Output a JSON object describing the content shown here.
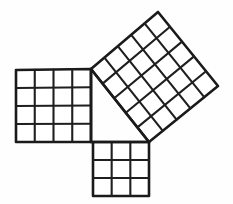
{
  "figure": {
    "background_color": "#fefefe",
    "line_color": "#1a1a1a"
  },
  "chart_data": {
    "type": "diagram",
    "xlabel": "",
    "ylabel": "",
    "grid": true,
    "legend": "none",
    "triangle": {
      "name": "right-triangle",
      "side_ratio": [
        3,
        4,
        5
      ],
      "right_angle_at": "bottom-left",
      "vertices": [
        {
          "label": "top",
          "x": 91,
          "y": 69
        },
        {
          "label": "bottom-left",
          "x": 91,
          "y": 142
        },
        {
          "label": "bottom-right",
          "x": 149,
          "y": 142
        }
      ]
    },
    "squares": [
      {
        "name": "left-square",
        "side_label": "vertical leg",
        "divisions": 4,
        "cells": 16,
        "rotation_deg": 0,
        "corners": [
          {
            "x": 16,
            "y": 70
          },
          {
            "x": 91,
            "y": 69
          },
          {
            "x": 91,
            "y": 142
          },
          {
            "x": 16,
            "y": 142
          }
        ]
      },
      {
        "name": "bottom-square",
        "side_label": "horizontal leg",
        "divisions": 3,
        "cells": 9,
        "rotation_deg": 0,
        "corners": [
          {
            "x": 93,
            "y": 142
          },
          {
            "x": 149,
            "y": 142
          },
          {
            "x": 149,
            "y": 196
          },
          {
            "x": 93,
            "y": 196
          }
        ]
      },
      {
        "name": "hypotenuse-square",
        "side_label": "hypotenuse",
        "divisions": 5,
        "cells": 25,
        "rotation_deg": 38,
        "corners": [
          {
            "x": 91,
            "y": 69
          },
          {
            "x": 158,
            "y": 12
          },
          {
            "x": 218,
            "y": 86
          },
          {
            "x": 149,
            "y": 142
          }
        ]
      }
    ],
    "relation": {
      "statement": "16 + 9 = 25",
      "leg_a_cells": 16,
      "leg_b_cells": 9,
      "hypotenuse_cells": 25
    }
  }
}
